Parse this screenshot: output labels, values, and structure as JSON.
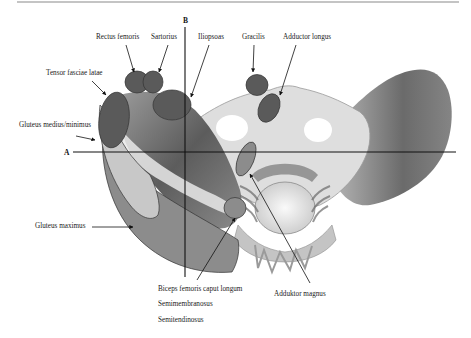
{
  "figure": {
    "width": 471,
    "height": 338,
    "top_rule": {
      "x1": 17,
      "x2": 459,
      "y": 2,
      "color": "#8a8a8a"
    },
    "axes": {
      "A": {
        "label": "A",
        "label_x": 64,
        "label_y": 155,
        "x1": 73,
        "x2": 456,
        "y": 152
      },
      "B": {
        "label": "B",
        "label_x": 183,
        "label_y": 23,
        "x": 185,
        "y1": 27,
        "y2": 277
      }
    },
    "colors": {
      "muscle_dark": "#5a5a5a",
      "muscle_mid": "#8c8c8c",
      "muscle_light": "#c8c8c8",
      "muscle_stroke": "#333333",
      "bone_fill": "#e6e6e6",
      "tissue_dark": "#6e6e6e",
      "text": "#1a1a1a",
      "line": "#111111"
    },
    "labels": [
      {
        "id": "rectus-femoris",
        "text": "Rectus femoris",
        "x": 96,
        "y": 39,
        "arrow": [
          126,
          45,
          134,
          72
        ]
      },
      {
        "id": "sartorius",
        "text": "Sartorius",
        "x": 151,
        "y": 39,
        "arrow": [
          168,
          45,
          159,
          72
        ]
      },
      {
        "id": "iliopsoas",
        "text": "Iliopsoas",
        "x": 198,
        "y": 39,
        "arrow": [
          209,
          45,
          191,
          97
        ]
      },
      {
        "id": "gracilis",
        "text": "Gracilis",
        "x": 242,
        "y": 39,
        "arrow": [
          254,
          45,
          253,
          72
        ]
      },
      {
        "id": "adductor-longus",
        "text": "Adductor longus",
        "x": 283,
        "y": 39,
        "arrow": [
          296,
          45,
          280,
          95
        ]
      },
      {
        "id": "tensor-fasciae-latae",
        "text": "Tensor fasciae latae",
        "x": 46,
        "y": 75,
        "arrow": [
          92,
          81,
          106,
          95
        ]
      },
      {
        "id": "gluteus-medius-minimus",
        "text": "Gluteus medius/minimus",
        "x": 19,
        "y": 127,
        "arrow": [
          76,
          136,
          95,
          140
        ]
      },
      {
        "id": "gluteus-maximus",
        "text": "Gluteus maximus",
        "x": 35,
        "y": 228,
        "arrow": [
          92,
          227,
          133,
          227
        ]
      },
      {
        "id": "biceps-femoris",
        "text": "Biceps femoris caput longum",
        "x": 158,
        "y": 291,
        "arrow": [
          197,
          280,
          235,
          218
        ]
      },
      {
        "id": "semimembranosus",
        "text": "Semimembranosus",
        "x": 158,
        "y": 306,
        "arrow": null
      },
      {
        "id": "semitendinosus",
        "text": "Semitendinosus",
        "x": 158,
        "y": 322,
        "arrow": null
      },
      {
        "id": "adduktor-magnus",
        "text": "Adduktor magnus",
        "x": 274,
        "y": 296,
        "arrow": [
          310,
          283,
          250,
          174
        ]
      }
    ]
  }
}
